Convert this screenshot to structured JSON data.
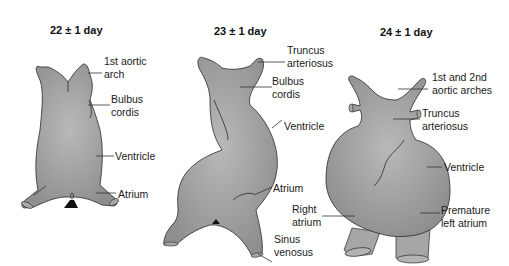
{
  "figure": {
    "colors": {
      "tissue": "#9a9a9a",
      "tissue_light": "#b8b8b8",
      "outline": "#2a2a2a",
      "leader": "#333333",
      "text": "#1a1a1a"
    },
    "panels": [
      {
        "id": "day22",
        "title": "22 ± 1 day",
        "labels": [
          {
            "line1": "1st aortic",
            "line2": "arch"
          },
          {
            "line1": "Bulbus",
            "line2": "cordis"
          },
          {
            "line1": "Ventricle",
            "line2": ""
          },
          {
            "line1": "Atrium",
            "line2": ""
          }
        ]
      },
      {
        "id": "day23",
        "title": "23 ± 1 day",
        "labels": [
          {
            "line1": "Truncus",
            "line2": "arteriosus"
          },
          {
            "line1": "Bulbus",
            "line2": "cordis"
          },
          {
            "line1": "Ventricle",
            "line2": ""
          },
          {
            "line1": "Atrium",
            "line2": ""
          },
          {
            "line1": "Sinus",
            "line2": "venosus"
          }
        ]
      },
      {
        "id": "day24",
        "title": "24 ± 1 day",
        "labels": [
          {
            "line1": "1st and 2nd",
            "line2": "aortic arches"
          },
          {
            "line1": "Truncus",
            "line2": "arteriosus"
          },
          {
            "line1": "Ventricle",
            "line2": ""
          },
          {
            "line1": "Right",
            "line2": "atrium"
          },
          {
            "line1": "Premature",
            "line2": "left atrium"
          }
        ]
      }
    ]
  }
}
